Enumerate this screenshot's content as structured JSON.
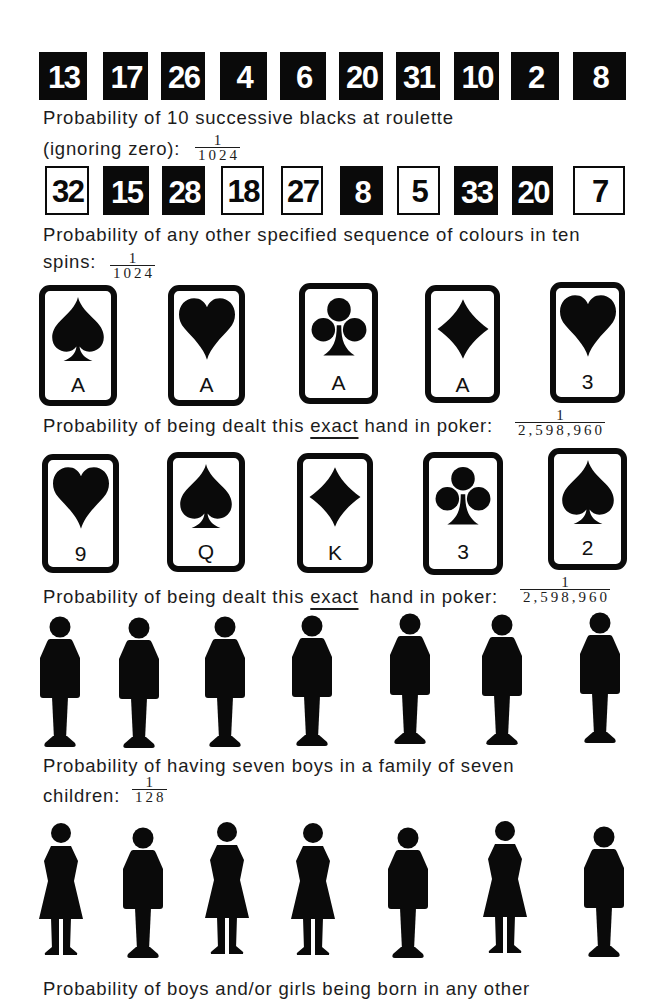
{
  "palette": {
    "ink": "#0a0a0a",
    "paper": "#ffffff"
  },
  "roulette": {
    "sequence_1": {
      "boxes": [
        {
          "number": "13",
          "color": "black"
        },
        {
          "number": "17",
          "color": "black"
        },
        {
          "number": "26",
          "color": "black"
        },
        {
          "number": "4",
          "color": "black"
        },
        {
          "number": "6",
          "color": "black"
        },
        {
          "number": "20",
          "color": "black"
        },
        {
          "number": "31",
          "color": "black"
        },
        {
          "number": "10",
          "color": "black"
        },
        {
          "number": "2",
          "color": "black"
        },
        {
          "number": "8",
          "color": "black"
        }
      ],
      "caption_line1": "Probability of 10 successive blacks at roulette",
      "caption_line2": "(ignoring zero):",
      "probability": {
        "numerator": "1",
        "denominator": "1024"
      }
    },
    "sequence_2": {
      "boxes": [
        {
          "number": "32",
          "color": "white"
        },
        {
          "number": "15",
          "color": "black"
        },
        {
          "number": "28",
          "color": "black"
        },
        {
          "number": "18",
          "color": "white"
        },
        {
          "number": "27",
          "color": "white"
        },
        {
          "number": "8",
          "color": "black"
        },
        {
          "number": "5",
          "color": "white"
        },
        {
          "number": "33",
          "color": "black"
        },
        {
          "number": "20",
          "color": "black"
        },
        {
          "number": "7",
          "color": "white"
        }
      ],
      "caption_line1": "Probability of any other specified sequence of colours in ten",
      "caption_line2": "spins:",
      "probability": {
        "numerator": "1",
        "denominator": "1024"
      }
    }
  },
  "poker": {
    "hand_1": {
      "cards": [
        {
          "rank": "A",
          "suit": "spade"
        },
        {
          "rank": "A",
          "suit": "heart"
        },
        {
          "rank": "A",
          "suit": "club"
        },
        {
          "rank": "A",
          "suit": "diamond"
        },
        {
          "rank": "3",
          "suit": "heart"
        }
      ],
      "caption_before": "Probability of being dealt this ",
      "caption_emphasis": "exact",
      "caption_after": " hand in poker:",
      "probability": {
        "numerator": "1",
        "denominator": "2,598,960"
      }
    },
    "hand_2": {
      "cards": [
        {
          "rank": "9",
          "suit": "heart"
        },
        {
          "rank": "Q",
          "suit": "spade"
        },
        {
          "rank": "K",
          "suit": "diamond"
        },
        {
          "rank": "3",
          "suit": "club"
        },
        {
          "rank": "2",
          "suit": "spade"
        }
      ],
      "caption_before": "Probability of being dealt this ",
      "caption_emphasis": "exact",
      "caption_after": " hand in poker:",
      "probability": {
        "numerator": "1",
        "denominator": "2,598,960"
      }
    }
  },
  "families": {
    "family_1": {
      "children": [
        "boy",
        "boy",
        "boy",
        "boy",
        "boy",
        "boy",
        "boy"
      ],
      "caption_line1": "Probability of having seven boys in a family of seven",
      "caption_line2": "children:",
      "probability": {
        "numerator": "1",
        "denominator": "128"
      }
    },
    "family_2": {
      "children": [
        "girl",
        "boy",
        "girl",
        "girl",
        "boy",
        "girl",
        "boy"
      ],
      "caption_line1": "Probability of boys and/or girls being born in any other"
    }
  }
}
